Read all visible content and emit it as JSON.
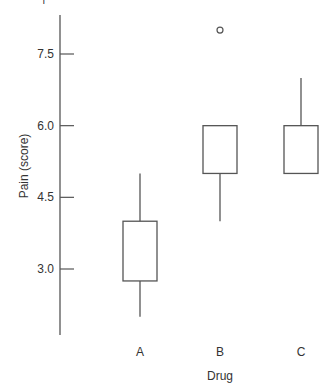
{
  "chart_data": {
    "type": "box",
    "title": "",
    "xlabel": "Drug",
    "ylabel": "Pain (score)",
    "categories": [
      "A",
      "B",
      "C"
    ],
    "yticks": [
      "3.0",
      "4.5",
      "6.0",
      "7.5"
    ],
    "ytick_values": [
      3.0,
      4.5,
      6.0,
      7.5
    ],
    "ylim": [
      1.3,
      8.3
    ],
    "grid": false,
    "legend": null,
    "boxes": [
      {
        "category": "A",
        "whisker_low": 2.0,
        "q1": 2.75,
        "median": null,
        "q3": 4.0,
        "whisker_high": 5.0,
        "outliers": []
      },
      {
        "category": "B",
        "whisker_low": 4.0,
        "q1": 5.0,
        "median": null,
        "q3": 6.0,
        "whisker_high": 6.0,
        "outliers": [
          8.0
        ]
      },
      {
        "category": "C",
        "whisker_low": 5.0,
        "q1": 5.0,
        "median": null,
        "q3": 6.0,
        "whisker_high": 7.0,
        "outliers": []
      }
    ]
  },
  "style": {
    "line_color": "#555555",
    "text_color": "#333333",
    "background": "#ffffff"
  }
}
